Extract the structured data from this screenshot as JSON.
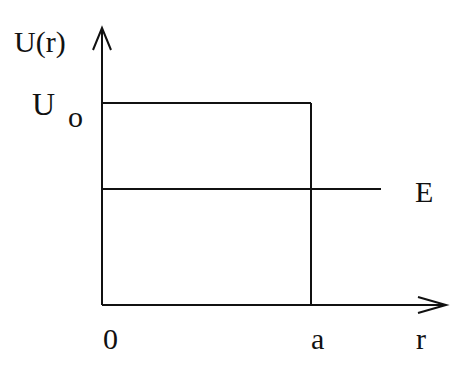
{
  "diagram": {
    "type": "potential-well",
    "y_axis_label": "U(r)",
    "x_axis_label": "r",
    "barrier_label_main": "U",
    "barrier_label_sub": "o",
    "energy_label": "E",
    "origin_label": "0",
    "width_label": "a",
    "line_color": "#111111"
  }
}
